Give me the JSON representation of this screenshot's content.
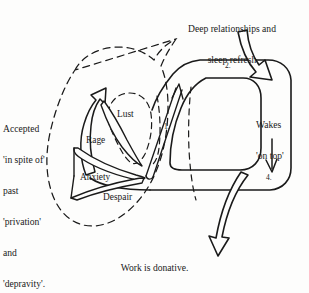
{
  "figure": {
    "title_caption": "Work is donative.",
    "background_color": "#fdfdfc",
    "ink_color": "#1a1a1a",
    "style": "hand-drawn ink diagram, scanned page"
  },
  "annotations": {
    "top_note_line1": "Deep relationships and",
    "top_note_line2": "sleep refresh",
    "left_note_line1": "Accepted",
    "left_note_line2": "'in spite of'",
    "left_note_line3": "past",
    "left_note_line4": "'privation'",
    "left_note_line5": "and",
    "left_note_line6": "'depravity'.",
    "right_note_line1": "Wakes",
    "right_note_line2": "'on top'",
    "bottom_caption": "Work is donative."
  },
  "nodes": [
    {
      "id": "lust",
      "label": "Lust"
    },
    {
      "id": "rage",
      "label": "Rage"
    },
    {
      "id": "anxiety",
      "label": "Anxiety"
    },
    {
      "id": "despair",
      "label": "Despair"
    }
  ],
  "stage_markers": [
    {
      "id": "stage-1",
      "label": "1."
    },
    {
      "id": "stage-2",
      "label": "2."
    },
    {
      "id": "stage-4",
      "label": "4."
    }
  ],
  "arrows": [
    {
      "id": "inflow-arrow",
      "semantic": "thick hollow arrow entering from top right, pointing down-right"
    },
    {
      "id": "outflow-arrow",
      "semantic": "thick hollow arrow leaving downward toward caption"
    },
    {
      "id": "rise-arrow",
      "semantic": "thin double-line arrow rising diagonally up-right, marker 1."
    },
    {
      "id": "descend-arrow",
      "semantic": "thin arrow pointing straight down on right side, marker 4."
    },
    {
      "id": "escape-arrow",
      "semantic": "hollow arrow pointing up-left out of the rage region"
    }
  ]
}
